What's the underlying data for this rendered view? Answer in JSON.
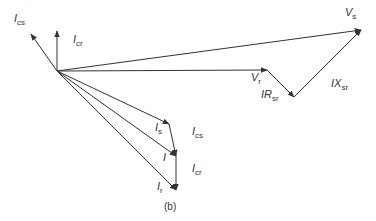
{
  "diagram": {
    "caption": "(b)",
    "origin": {
      "x": 57,
      "y": 71
    },
    "colors": {
      "stroke": "#333333",
      "background": "#ffffff"
    },
    "vectors": [
      {
        "id": "I_cs_top",
        "label_main": "I",
        "label_sub": "cs",
        "from": [
          57,
          71
        ],
        "to": [
          31,
          34
        ],
        "label_pos": [
          14,
          22
        ]
      },
      {
        "id": "I_cr_top",
        "label_main": "I",
        "label_sub": "cr",
        "from": [
          57,
          71
        ],
        "to": [
          57,
          31
        ],
        "label_pos": [
          73,
          43
        ]
      },
      {
        "id": "V_s",
        "label_main": "V",
        "label_sub": "s",
        "from": [
          57,
          71
        ],
        "to": [
          361,
          30
        ],
        "label_pos": [
          345,
          16
        ]
      },
      {
        "id": "V_r",
        "label_main": "V",
        "label_sub": "r",
        "from": [
          57,
          71
        ],
        "to": [
          267,
          70
        ],
        "label_pos": [
          251,
          81
        ]
      },
      {
        "id": "IR_sr",
        "label_main": "IR",
        "label_sub": "sr",
        "from": [
          267,
          70
        ],
        "to": [
          294,
          97
        ],
        "label_pos": [
          261,
          98
        ]
      },
      {
        "id": "IX_sr",
        "label_main": "IX",
        "label_sub": "sr",
        "from": [
          294,
          97
        ],
        "to": [
          361,
          30
        ],
        "label_pos": [
          331,
          87
        ]
      },
      {
        "id": "I_s",
        "label_main": "I",
        "label_sub": "s",
        "from": [
          57,
          71
        ],
        "to": [
          169,
          124
        ],
        "label_pos": [
          155,
          131
        ]
      },
      {
        "id": "I",
        "label_main": "I",
        "label_sub": "",
        "from": [
          57,
          71
        ],
        "to": [
          176,
          156
        ],
        "label_pos": [
          163,
          161
        ]
      },
      {
        "id": "I_r",
        "label_main": "I",
        "label_sub": "r",
        "from": [
          57,
          71
        ],
        "to": [
          176,
          190
        ],
        "label_pos": [
          157,
          190
        ]
      },
      {
        "id": "I_cs_bottom",
        "label_main": "I",
        "label_sub": "cs",
        "from": [
          169,
          124
        ],
        "to": [
          176,
          156
        ],
        "label_pos": [
          192,
          135
        ]
      },
      {
        "id": "I_cr_bottom",
        "label_main": "I",
        "label_sub": "cr",
        "from": [
          176,
          156
        ],
        "to": [
          176,
          190
        ],
        "label_pos": [
          192,
          172
        ]
      }
    ],
    "caption_pos": [
      164,
      210
    ]
  }
}
